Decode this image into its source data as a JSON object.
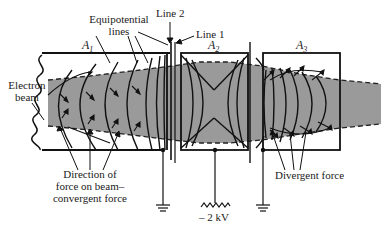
{
  "diagram": {
    "type": "electrostatic-lens",
    "labels": {
      "electron_beam": [
        "Electron",
        "beam"
      ],
      "equipotential_lines": [
        "Equipotential",
        "lines"
      ],
      "line2": "Line 2",
      "line1": "Line 1",
      "convergent": [
        "Direction of",
        "force on beam–",
        "convergent force"
      ],
      "divergent": "Divergent force",
      "voltage": "– 2 kV"
    },
    "electrodes": [
      {
        "id": "A1",
        "letter": "A",
        "sub": "1",
        "potential": "ground"
      },
      {
        "id": "A2",
        "letter": "A",
        "sub": "2",
        "potential": "– 2 kV"
      },
      {
        "id": "A3",
        "letter": "A",
        "sub": "3",
        "potential": "ground"
      }
    ],
    "colors": {
      "beam": "#8f8f8f",
      "line": "#111111",
      "background": "#ffffff"
    }
  }
}
